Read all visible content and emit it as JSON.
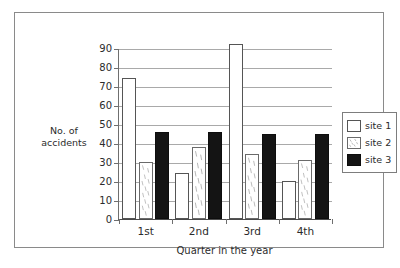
{
  "chart_data": {
    "type": "bar",
    "title": "",
    "subtitle": "",
    "xlabel": "Quarter in the year",
    "ylabel": "No. of accidents",
    "ylabel_lines": [
      "No. of",
      "accidents"
    ],
    "categories": [
      "1st",
      "2nd",
      "3rd",
      "4th"
    ],
    "series": [
      {
        "name": "site 1",
        "fill": "white",
        "color": "#ffffff",
        "edge_color": "#555555",
        "values": [
          74,
          24,
          92,
          20
        ],
        "notes": [
          "",
          "",
          "exceeds plotted axis maximum",
          ""
        ]
      },
      {
        "name": "site 2",
        "fill": "speckled",
        "color": "#ffffff",
        "edge_color": "#6a6a6a",
        "values": [
          30,
          38,
          34,
          31
        ],
        "notes": [
          "",
          "",
          "",
          ""
        ]
      },
      {
        "name": "site 3",
        "fill": "solid-black",
        "color": "#141414",
        "edge_color": "#0d0d0d",
        "values": [
          46,
          46,
          45,
          45
        ],
        "notes": [
          "",
          "",
          "",
          ""
        ]
      }
    ],
    "ylim": [
      0,
      90
    ],
    "ytick_values": [
      0,
      10,
      20,
      30,
      40,
      50,
      60,
      70,
      80,
      90
    ],
    "ytick_labels": [
      "0",
      "10",
      "20",
      "30",
      "40",
      "50",
      "60",
      "70",
      "80",
      "90"
    ],
    "grid": true,
    "grid_axis": "y",
    "legend_position": "right",
    "legend_entries": [
      "site 1",
      "site 2",
      "site 3"
    ],
    "annotations": []
  },
  "legend": {
    "items": [
      {
        "label": "site 1",
        "swatch": "white-swatch-icon"
      },
      {
        "label": "site 2",
        "swatch": "speckled-swatch-icon"
      },
      {
        "label": "site 3",
        "swatch": "black-swatch-icon"
      }
    ]
  },
  "colors": {
    "background": "#ffffff",
    "frame_border": "#8a8a8a",
    "gridline": "#a9a9a9",
    "axis": "#4a4a4a",
    "text": "#2b2b2b",
    "site_3_fill": "#141414"
  }
}
